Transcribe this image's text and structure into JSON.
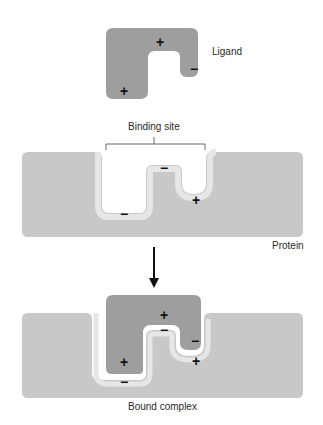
{
  "labels": {
    "ligand": "Ligand",
    "binding_site": "Binding site",
    "protein": "Protein",
    "bound_complex": "Bound complex"
  },
  "charges": {
    "ligand": [
      "+",
      "+",
      "−"
    ],
    "protein_site": [
      "−",
      "−",
      "+"
    ],
    "complex_ligand": [
      "+",
      "+",
      "−"
    ],
    "complex_protein": [
      "−",
      "−",
      "+"
    ]
  },
  "colors": {
    "ligand_fill": "#9e9e9e",
    "protein_fill": "#c8c8c8",
    "site_lining": "#e6e6e6",
    "text": "#2a2a2a",
    "background": "#ffffff"
  }
}
